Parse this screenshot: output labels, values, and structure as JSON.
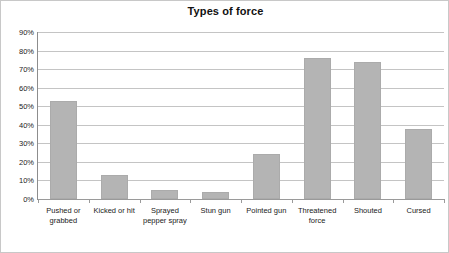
{
  "chart_data": {
    "type": "bar",
    "title": "Types of force",
    "xlabel": "",
    "ylabel": "",
    "categories": [
      "Pushed or grabbed",
      "Kicked or hit",
      "Sprayed pepper spray",
      "Stun gun",
      "Pointed gun",
      "Threatened force",
      "Shouted",
      "Cursed"
    ],
    "values": [
      53,
      13,
      5,
      4,
      24,
      76,
      74,
      38
    ],
    "ylim": [
      0,
      90
    ],
    "ytick_labels": [
      "0%",
      "10%",
      "20%",
      "30%",
      "40%",
      "50%",
      "60%",
      "70%",
      "80%",
      "90%"
    ],
    "ytick_values": [
      0,
      10,
      20,
      30,
      40,
      50,
      60,
      70,
      80,
      90
    ],
    "grid": true,
    "legend": "none",
    "bar_color": "#b4b4b4",
    "grid_color": "#c4c4c4",
    "axis_color": "#8d8d8d",
    "title_color": "#111111"
  }
}
